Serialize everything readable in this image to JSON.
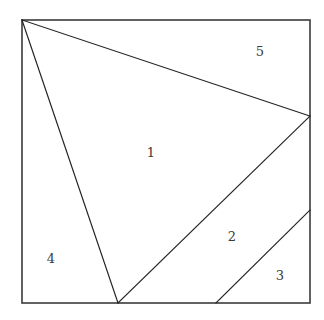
{
  "figure": {
    "type": "geometric-partition-diagram",
    "canvas": {
      "width": 324,
      "height": 320,
      "background": "#ffffff"
    },
    "boundary": {
      "shape": "square",
      "stroke_color": "#3b3b3b",
      "fill_color": "#ffffff",
      "x": 22,
      "y": 20,
      "width": 288,
      "height": 283,
      "corners": {
        "top_left": [
          22,
          20
        ],
        "top_right": [
          310,
          20
        ],
        "bottom_right": [
          310,
          303
        ],
        "bottom_left": [
          22,
          303
        ]
      }
    },
    "line_color": "#222222",
    "vertices": {
      "apex_top_left": [
        22,
        20
      ],
      "right_upper": [
        310,
        116
      ],
      "right_lower": [
        310,
        210
      ],
      "bottom_mid": [
        118,
        303
      ],
      "bottom_right_mid": [
        216,
        303
      ]
    },
    "segments": [
      {
        "name": "apex-to-right-upper",
        "x1": 22,
        "y1": 20,
        "x2": 310,
        "y2": 116
      },
      {
        "name": "apex-to-bottom-mid",
        "x1": 22,
        "y1": 20,
        "x2": 118,
        "y2": 303
      },
      {
        "name": "bottom-mid-to-right-upper",
        "x1": 118,
        "y1": 303,
        "x2": 310,
        "y2": 116
      },
      {
        "name": "bottom-right-mid-to-right-lower",
        "x1": 216,
        "y1": 303,
        "x2": 310,
        "y2": 210
      }
    ],
    "regions": [
      {
        "id": "region-1",
        "label": "1",
        "x": 151,
        "y": 153
      },
      {
        "id": "region-2",
        "label": "2",
        "x": 232,
        "y": 237
      },
      {
        "id": "region-3",
        "label": "3",
        "x": 280,
        "y": 276
      },
      {
        "id": "region-4",
        "label": "4",
        "x": 51,
        "y": 259
      },
      {
        "id": "region-5",
        "label": "5",
        "x": 260,
        "y": 52
      }
    ]
  }
}
